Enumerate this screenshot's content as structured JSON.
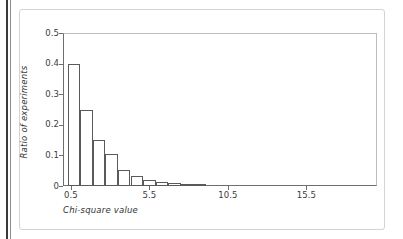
{
  "figure": {
    "background_color": "#ffffff",
    "frame_color": "#d3d3d3",
    "axis_color": "#6e6e6e",
    "bar_edge_color": "#5a5a5a",
    "bar_fill_color": "#ffffff"
  },
  "chart_data": {
    "type": "bar",
    "title": "",
    "subtitle": "",
    "xlabel": "Chi-square value",
    "ylabel": "Ratio of experiments",
    "xlim": [
      0,
      20
    ],
    "ylim": [
      0,
      0.5
    ],
    "grid": false,
    "legend": null,
    "xticks": [
      0.5,
      5.5,
      10.5,
      15.5
    ],
    "xtick_labels": [
      "0.5",
      "5.5",
      "10.5",
      "15.5"
    ],
    "yticks": [
      0,
      0.1,
      0.2,
      0.3,
      0.4,
      0.5
    ],
    "ytick_labels": [
      "0",
      "0.1",
      "0.2",
      "0.3",
      "0.4",
      "0.5"
    ],
    "bin_width": 0.8,
    "x_start": 0.3,
    "categories": [
      "0.3-1.1",
      "1.1-1.9",
      "1.9-2.7",
      "2.7-3.5",
      "3.5-4.3",
      "4.3-5.1",
      "5.1-5.9",
      "5.9-6.7",
      "6.7-7.5",
      "7.5-8.3",
      "8.3-9.1"
    ],
    "x": [
      0.7,
      1.5,
      2.3,
      3.1,
      3.9,
      4.7,
      5.5,
      6.3,
      7.1,
      7.9,
      8.7
    ],
    "values": [
      0.4,
      0.25,
      0.152,
      0.104,
      0.052,
      0.032,
      0.02,
      0.013,
      0.009,
      0.007,
      0.005
    ],
    "annotations": []
  },
  "axis_titles": {
    "x": "Chi-square value",
    "y": "Ratio of experiments"
  }
}
